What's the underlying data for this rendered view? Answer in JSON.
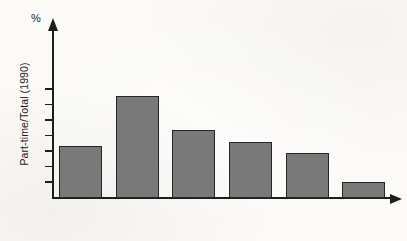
{
  "chart_data": {
    "type": "bar",
    "title": "",
    "xlabel": "",
    "ylabel": "Part-time/Total (1990)",
    "unit_label": "%",
    "categories": [
      "US",
      "Neth.",
      "UK",
      "Japan",
      "Germany",
      "Spain"
    ],
    "values": [
      16.8,
      32.8,
      22.0,
      18.0,
      14.5,
      5.3
    ],
    "ylim": [
      0,
      37
    ],
    "yticks": [
      0,
      5,
      10,
      15,
      20,
      25,
      30,
      35
    ],
    "ytick_labels": [
      "0",
      "5",
      "10",
      "15",
      "20",
      "25",
      "30",
      "35"
    ],
    "grid": false,
    "legend": false,
    "bar_color": "#79797a",
    "bar_edge_color": "#26262a",
    "axis_color": "#1d1d1b"
  }
}
